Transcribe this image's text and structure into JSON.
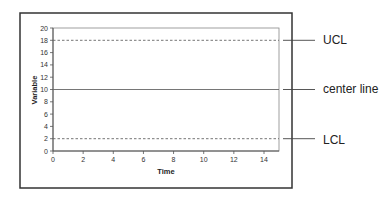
{
  "chart_data": {
    "type": "line",
    "title": "",
    "xlabel": "Time",
    "ylabel": "Variable",
    "xlim": [
      0,
      15
    ],
    "ylim": [
      0,
      20
    ],
    "x_ticks": [
      0,
      2,
      4,
      6,
      8,
      10,
      12,
      14
    ],
    "y_ticks": [
      0,
      2,
      4,
      6,
      8,
      10,
      12,
      14,
      16,
      18,
      20
    ],
    "grid": false,
    "legend": "none",
    "series": [
      {
        "name": "UCL",
        "style": "dashed",
        "x": [
          0,
          15
        ],
        "values": [
          18,
          18
        ]
      },
      {
        "name": "center line",
        "style": "solid",
        "x": [
          0,
          15
        ],
        "values": [
          10,
          10
        ]
      },
      {
        "name": "LCL",
        "style": "dashed",
        "x": [
          0,
          15
        ],
        "values": [
          2,
          2
        ]
      }
    ],
    "annotations": [
      "UCL",
      "center line",
      "LCL"
    ]
  },
  "labels": {
    "ucl": "UCL",
    "center": "center line",
    "lcl": "LCL",
    "xlabel": "Time",
    "ylabel": "Variable"
  }
}
